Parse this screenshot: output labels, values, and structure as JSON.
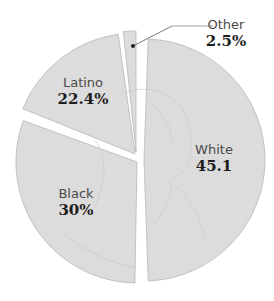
{
  "chart_data": {
    "type": "pie",
    "title": "",
    "slices": [
      {
        "name": "White",
        "value": 45.1,
        "label": "White",
        "value_label": "45.1"
      },
      {
        "name": "Black",
        "value": 30,
        "label": "Black",
        "value_label": "30%"
      },
      {
        "name": "Latino",
        "value": 22.4,
        "label": "Latino",
        "value_label": "22.4%"
      },
      {
        "name": "Other",
        "value": 2.5,
        "label": "Other",
        "value_label": "2.5%"
      }
    ],
    "exploded": true,
    "background_texture": "faint portrait engraving",
    "colors": {
      "slice_fill": "#dcdcdc",
      "slice_edge": "#b8b8b8",
      "gap": "#ffffff",
      "label_text": "#4a4a4a",
      "value_text": "#1e1e1e"
    }
  }
}
